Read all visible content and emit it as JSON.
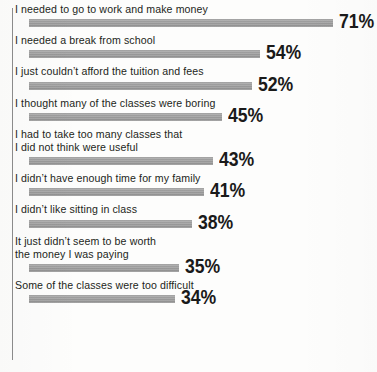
{
  "chart_data": {
    "type": "bar",
    "orientation": "horizontal",
    "title": "",
    "xlabel": "",
    "ylabel": "",
    "xlim": [
      0,
      100
    ],
    "grid": false,
    "legend": null,
    "value_suffix": "%",
    "categories": [
      "I needed to go to work and make money",
      "I needed a break from school",
      "I just couldn’t afford the tuition and fees",
      "I thought many of the classes were boring",
      "I had to take too many classes that\n I did not think were useful",
      "I didn’t have enough time for my family",
      "I didn’t like sitting in class",
      "It just didn’t seem to be worth\n the money I was paying",
      "Some of the classes were too difficult"
    ],
    "values": [
      71,
      54,
      52,
      45,
      43,
      41,
      38,
      35,
      34
    ],
    "value_labels": [
      "71%",
      "54%",
      "52%",
      "45%",
      "43%",
      "41%",
      "38%",
      "35%",
      "34%"
    ]
  },
  "style": {
    "bar_color": "#9a9a9a",
    "axis_color": "#8d8d8d",
    "label_color": "#231f20",
    "value_color": "#1a1a1a",
    "background": "#fdfdfc"
  }
}
